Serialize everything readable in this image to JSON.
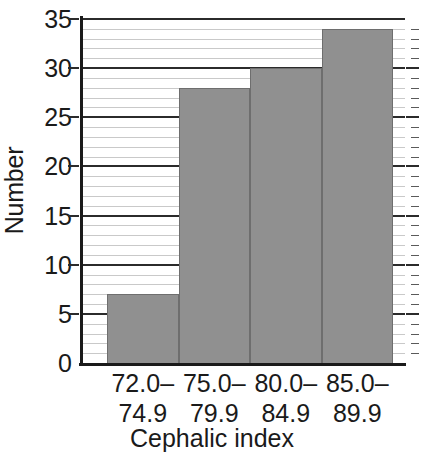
{
  "chart_data": {
    "type": "bar",
    "title": "",
    "subtitle": "",
    "xlabel": "Cephalic index",
    "ylabel": "Number",
    "categories": [
      "72.0–\n74.9",
      "75.0–\n79.9",
      "80.0–\n84.9",
      "85.0–\n89.9"
    ],
    "category_lines": [
      [
        "72.0–",
        "74.9"
      ],
      [
        "75.0–",
        "79.9"
      ],
      [
        "80.0–",
        "84.9"
      ],
      [
        "85.0–",
        "89.9"
      ]
    ],
    "values": [
      7,
      28,
      30,
      34
    ],
    "ylim": [
      0,
      35
    ],
    "xlim_note": "categorical, contiguous histogram bins",
    "ytick_labels": [
      "0",
      "5",
      "10",
      "15",
      "20",
      "25",
      "30",
      "35"
    ],
    "ytick_values": [
      0,
      5,
      10,
      15,
      20,
      25,
      30,
      35
    ],
    "minor_tick_step": 1,
    "grid": "horizontal major and minor gridlines across plot area",
    "legend": "none",
    "bar_color": "#909090",
    "bar_edge_color": "#6e6e6e",
    "major_gridline_color": "#2b2b2b",
    "minor_gridline_color": "#c9c9c9",
    "axis_color": "#1a1a1a",
    "background": "#ffffff",
    "right_axis": "tick marks only, no labels"
  },
  "axes": {
    "y_label": "Number",
    "x_label": "Cephalic index"
  }
}
